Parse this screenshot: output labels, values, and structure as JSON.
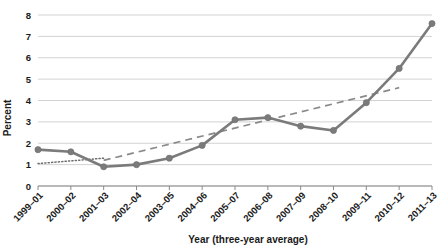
{
  "chart_data": {
    "type": "line",
    "title": "",
    "xlabel": "Year (three-year average)",
    "ylabel": "Percent",
    "categories": [
      "1999–01",
      "2000–02",
      "2001–03",
      "2002–04",
      "2003–05",
      "2004–06",
      "2005–07",
      "2006–08",
      "2007–09",
      "2008–10",
      "2009–11",
      "2010–12",
      "2011–13"
    ],
    "values": [
      1.7,
      1.6,
      0.9,
      1.0,
      1.3,
      1.9,
      3.1,
      3.2,
      2.8,
      2.6,
      3.9,
      5.5,
      7.6
    ],
    "series": [
      {
        "name": "percent-series",
        "style": "solid-marker-line",
        "values": [
          1.7,
          1.6,
          0.9,
          1.0,
          1.3,
          1.9,
          3.1,
          3.2,
          2.8,
          2.6,
          3.9,
          5.5,
          7.6
        ]
      },
      {
        "name": "early-trendline",
        "style": "fine-dotted",
        "x_range": [
          "1999–01",
          "2001–03"
        ],
        "y_range": [
          1.05,
          1.3
        ]
      },
      {
        "name": "late-trendline",
        "style": "dashed",
        "x_range": [
          "2001–03",
          "2010–12"
        ],
        "y_range": [
          1.2,
          4.6
        ]
      }
    ],
    "ylim": [
      0,
      8
    ],
    "yticks": [
      "0",
      "1",
      "2",
      "3",
      "4",
      "5",
      "6",
      "7",
      "8"
    ],
    "grid": true,
    "legend": "none",
    "colors": {
      "series": "#7b7b7b",
      "grid": "#d2d2d2",
      "axis": "#8a8a8a",
      "text": "#1a1a1a"
    }
  }
}
